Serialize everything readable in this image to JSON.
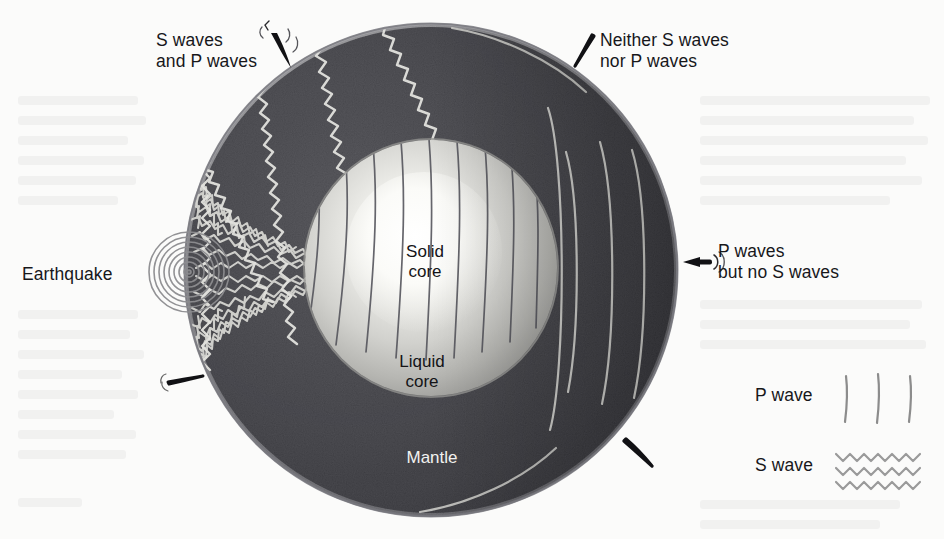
{
  "figure": {
    "kind": "earth-cross-section-seismic-waves",
    "background_color": "#fbfbfa"
  },
  "earth": {
    "center_x": 431,
    "center_y": 270,
    "radius": 247,
    "layers": [
      {
        "name": "Mantle",
        "label": "Mantle",
        "color": "#4b4b50"
      },
      {
        "name": "Liquid core",
        "label": "Liquid\ncore",
        "color": "#c9c9c6"
      },
      {
        "name": "Solid core",
        "label": "Solid\ncore",
        "color": "#f4f4f1"
      }
    ],
    "labels": {
      "solid_core": "Solid\ncore",
      "liquid_core": "Liquid\ncore",
      "mantle": "Mantle"
    }
  },
  "source": {
    "label": "Earthquake",
    "x": 190,
    "y": 272
  },
  "callouts": [
    {
      "id": "s-and-p",
      "text": "S waves\nand P waves",
      "x": 156,
      "y": 30,
      "arrow": "wiggle-arrow",
      "points_to": "upper-left-surface"
    },
    {
      "id": "neither",
      "text": "Neither S waves\nnor P waves",
      "x": 600,
      "y": 30,
      "arrow": "plain-arrow",
      "points_to": "upper-right-shadow-zone"
    },
    {
      "id": "p-only",
      "text": "P waves\nbut no S waves",
      "x": 718,
      "y": 241,
      "arrow": "pulse-arrow",
      "points_to": "right-surface"
    },
    {
      "id": "lower-left-surface",
      "text": "",
      "x": 168,
      "y": 378,
      "arrow": "wiggle-arrow",
      "points_to": "lower-left-surface"
    },
    {
      "id": "lower-right-shadow",
      "text": "",
      "x": 629,
      "y": 440,
      "arrow": "plain-arrow",
      "points_to": "lower-right-shadow-zone"
    }
  ],
  "legend": {
    "items": [
      {
        "label": "P wave",
        "symbol": "three-vertical-lines",
        "color": "#8c8c8c"
      },
      {
        "label": "S wave",
        "symbol": "three-zigzag-rows",
        "color": "#9a9a9a"
      }
    ],
    "x": 755,
    "p_wave_y": 394,
    "s_wave_y": 462
  },
  "colors": {
    "mantle": "#4b4b50",
    "mantle_shadow": "#3b3b40",
    "liquid_core": "#c9c9c6",
    "solid_core": "#fafaf7",
    "crust_rim": "#8f8f93",
    "ray_light": "#d8d8d4",
    "ray_dark": "#53535a",
    "ink": "#17171a",
    "arrow": "#111114"
  }
}
